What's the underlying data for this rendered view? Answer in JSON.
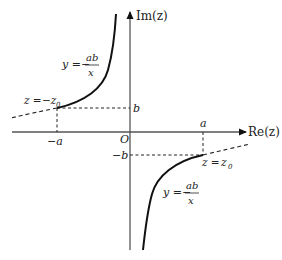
{
  "diagram": {
    "axes": {
      "x_label": "Re(z)",
      "y_label": "Im(z)",
      "origin_label": "O"
    },
    "ticks": {
      "x_pos": "a",
      "x_neg": "−a",
      "y_pos": "b",
      "y_neg": "−b"
    },
    "points": {
      "upper": {
        "label_lhs": "z =",
        "label_rhs": "−z",
        "sub": "0"
      },
      "lower": {
        "label_lhs": "z =",
        "label_rhs": "z",
        "sub": "0"
      }
    },
    "curve_labels": {
      "upper": {
        "lhs": "y =−",
        "num": "ab",
        "den": "x"
      },
      "lower": {
        "lhs": "y =−",
        "num": "ab",
        "den": "x"
      }
    },
    "colors": {
      "axis": "#555555",
      "curve": "#111111",
      "dashed": "#222222",
      "text": "#222222"
    }
  }
}
